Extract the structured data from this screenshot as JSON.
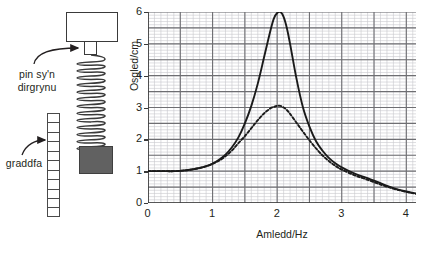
{
  "diagram": {
    "vibrator_label": "vibrator box",
    "pin_label": "pin sy'n\ndirgrynu",
    "scale_label": "graddfa",
    "mass_label": "mass",
    "ruler_segments": 11,
    "mass_color": "#616161",
    "outline_color": "#3a3a3a"
  },
  "chart_data": {
    "type": "line",
    "title": "",
    "xlabel": "Amledd/Hz",
    "ylabel": "Osgled/cm",
    "xlim": [
      0,
      4.15
    ],
    "ylim": [
      0,
      6
    ],
    "xticks": [
      "0",
      "1",
      "2",
      "3",
      "4"
    ],
    "xtick_values": [
      0,
      1,
      2,
      3,
      4
    ],
    "yticks": [
      "0",
      "1",
      "2",
      "3",
      "4",
      "5",
      "6"
    ],
    "ytick_values": [
      0,
      1,
      2,
      3,
      4,
      5,
      6
    ],
    "grid": true,
    "grid_minor_step": 0.1,
    "grid_major_step": 0.5,
    "grid_minor_color": "#c8c8cc",
    "grid_major_color": "#6e6e72",
    "legend": "none",
    "axis_color": "#3a3a3a",
    "x": [
      0.0,
      0.1,
      0.2,
      0.3,
      0.4,
      0.5,
      0.6,
      0.7,
      0.8,
      0.9,
      1.0,
      1.1,
      1.2,
      1.3,
      1.4,
      1.5,
      1.6,
      1.7,
      1.8,
      1.9,
      1.95,
      2.0,
      2.05,
      2.1,
      2.15,
      2.2,
      2.3,
      2.4,
      2.5,
      2.6,
      2.7,
      2.8,
      2.9,
      3.0,
      3.2,
      3.4,
      3.6,
      3.8,
      4.0,
      4.15
    ],
    "series": [
      {
        "name": "gwanychiad bach (solid)",
        "style": "solid",
        "color": "#1a1a1a",
        "peak_x": 2.05,
        "peak_y": 6.0,
        "values": [
          1.0,
          1.0,
          1.0,
          1.0,
          1.0,
          1.01,
          1.03,
          1.06,
          1.1,
          1.16,
          1.24,
          1.36,
          1.52,
          1.75,
          2.06,
          2.5,
          3.05,
          3.75,
          4.6,
          5.45,
          5.8,
          5.97,
          6.0,
          5.85,
          5.5,
          5.0,
          3.9,
          3.0,
          2.4,
          1.95,
          1.65,
          1.42,
          1.25,
          1.12,
          0.92,
          0.78,
          0.62,
          0.47,
          0.36,
          0.3
        ]
      },
      {
        "name": "gwanychiad mwy (dashed)",
        "style": "dashed",
        "color": "#1a1a1a",
        "peak_x": 2.05,
        "peak_y": 3.05,
        "values": [
          1.0,
          1.0,
          1.0,
          1.0,
          1.0,
          1.01,
          1.03,
          1.06,
          1.1,
          1.15,
          1.23,
          1.33,
          1.47,
          1.65,
          1.88,
          2.1,
          2.35,
          2.6,
          2.82,
          2.98,
          3.02,
          3.05,
          3.05,
          3.0,
          2.92,
          2.8,
          2.52,
          2.24,
          1.97,
          1.72,
          1.5,
          1.32,
          1.17,
          1.05,
          0.87,
          0.73,
          0.58,
          0.45,
          0.35,
          0.29
        ]
      }
    ]
  }
}
